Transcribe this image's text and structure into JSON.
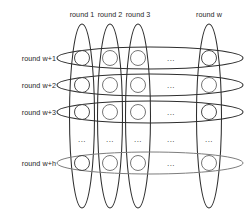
{
  "diagram": {
    "type": "grid-of-ellipses",
    "stroke_color": "#2e2e2e",
    "light_stroke_color": "#7d7d7d",
    "node_stroke_color": "#6f6f6f",
    "background_color": "#ffffff",
    "column_labels": [
      {
        "id": "col-round-1",
        "text": "round 1",
        "cx": 82
      },
      {
        "id": "col-round-2",
        "text": "round 2",
        "cx": 110
      },
      {
        "id": "col-round-3",
        "text": "round 3",
        "cx": 138
      },
      {
        "id": "col-round-w",
        "text": "round w",
        "cx": 209
      }
    ],
    "row_labels": [
      {
        "id": "row-round-w-1",
        "text": "round w+1",
        "cy": 58
      },
      {
        "id": "row-round-w-2",
        "text": "round w+2",
        "cy": 85
      },
      {
        "id": "row-round-w-3",
        "text": "round w+3",
        "cy": 112
      },
      {
        "id": "row-round-w-h",
        "text": "round w+h",
        "cy": 163
      }
    ],
    "ellipsis": {
      "glyph": "...",
      "column_gap_cx": 171,
      "row_gap_cy": 139,
      "row_positions": [
        58,
        85,
        112,
        163
      ],
      "column_positions": [
        82,
        110,
        138,
        209
      ]
    },
    "counts": {
      "columns": 4,
      "rows": 4,
      "nodes": 16
    },
    "notes": {
      "vertical_group": "each vertical ellipse groups one round column (round 1 .. round w)",
      "horizontal_group": "each horizontal ellipse groups one round row (round w+1 .. round w+h)",
      "node": "circle at every column/row intersection"
    }
  }
}
